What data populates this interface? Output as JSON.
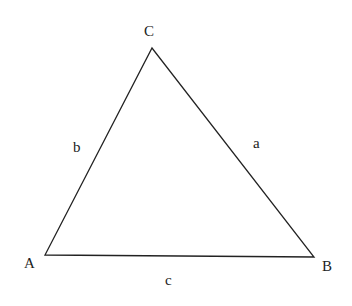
{
  "diagram": {
    "type": "triangle",
    "stroke_color": "#222222",
    "background": "#ffffff",
    "vertices": [
      {
        "name": "A",
        "x": 45,
        "y": 255,
        "label_x": 24,
        "label_y": 268
      },
      {
        "name": "B",
        "x": 314,
        "y": 257,
        "label_x": 322,
        "label_y": 271
      },
      {
        "name": "C",
        "x": 152,
        "y": 48,
        "label_x": 144,
        "label_y": 36
      }
    ],
    "sides": [
      {
        "name": "a",
        "from": "B",
        "to": "C",
        "label_x": 253,
        "label_y": 148
      },
      {
        "name": "b",
        "from": "A",
        "to": "C",
        "label_x": 73,
        "label_y": 152
      },
      {
        "name": "c",
        "from": "A",
        "to": "B",
        "label_x": 165,
        "label_y": 285
      }
    ]
  }
}
